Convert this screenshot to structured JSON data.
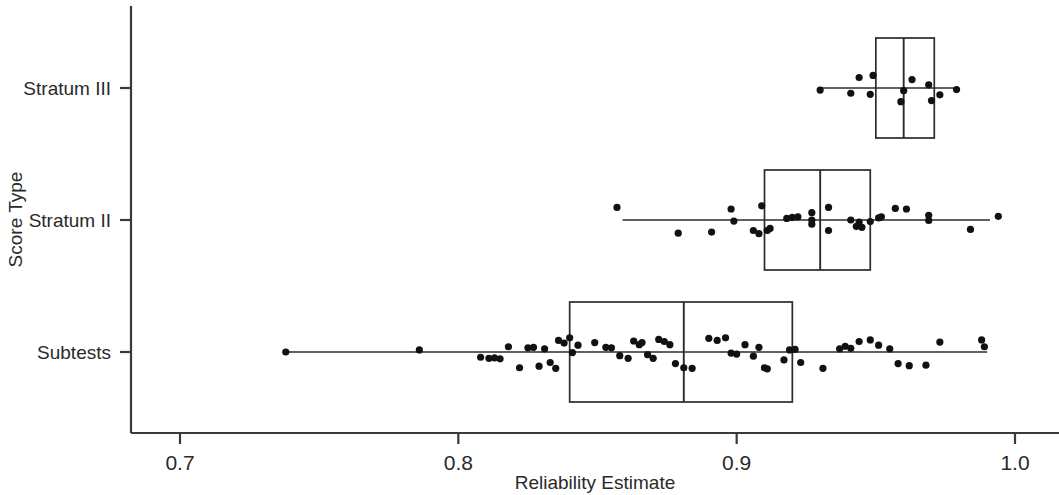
{
  "chart_data": {
    "type": "box",
    "title": "",
    "xlabel": "Reliability Estimate",
    "ylabel": "Score Type",
    "orientation": "horizontal",
    "grid": false,
    "legend": null,
    "xlim": [
      0.665,
      1.02
    ],
    "xticks": [
      0.7,
      0.8,
      0.9,
      1.0
    ],
    "xticklabels": [
      "0.7",
      "0.8",
      "0.9",
      "1.0"
    ],
    "categories": [
      "Stratum III",
      "Stratum II",
      "Subtests"
    ],
    "series": [
      {
        "name": "Stratum III",
        "q1": 0.95,
        "median": 0.96,
        "q3": 0.971,
        "whisker_low": 0.93,
        "whisker_high": 0.979,
        "points": [
          {
            "x": 0.93,
            "jitter": 0.04
          },
          {
            "x": 0.944,
            "jitter": -0.2
          },
          {
            "x": 0.949,
            "jitter": -0.24
          },
          {
            "x": 0.941,
            "jitter": 0.1
          },
          {
            "x": 0.948,
            "jitter": 0.12
          },
          {
            "x": 0.96,
            "jitter": 0.05
          },
          {
            "x": 0.963,
            "jitter": -0.16
          },
          {
            "x": 0.959,
            "jitter": 0.26
          },
          {
            "x": 0.969,
            "jitter": -0.06
          },
          {
            "x": 0.97,
            "jitter": 0.24
          },
          {
            "x": 0.973,
            "jitter": 0.13
          },
          {
            "x": 0.979,
            "jitter": 0.03
          }
        ]
      },
      {
        "name": "Stratum II",
        "q1": 0.91,
        "median": 0.93,
        "q3": 0.948,
        "whisker_low": 0.859,
        "whisker_high": 0.991,
        "points": [
          {
            "x": 0.857,
            "jitter": -0.24
          },
          {
            "x": 0.898,
            "jitter": -0.21
          },
          {
            "x": 0.909,
            "jitter": -0.27
          },
          {
            "x": 0.899,
            "jitter": 0.02
          },
          {
            "x": 0.879,
            "jitter": 0.25
          },
          {
            "x": 0.891,
            "jitter": 0.23
          },
          {
            "x": 0.906,
            "jitter": 0.2
          },
          {
            "x": 0.912,
            "jitter": 0.16
          },
          {
            "x": 0.918,
            "jitter": -0.03
          },
          {
            "x": 0.92,
            "jitter": -0.05
          },
          {
            "x": 0.922,
            "jitter": -0.06
          },
          {
            "x": 0.927,
            "jitter": -0.14
          },
          {
            "x": 0.927,
            "jitter": 0.0
          },
          {
            "x": 0.927,
            "jitter": 0.08
          },
          {
            "x": 0.933,
            "jitter": -0.24
          },
          {
            "x": 0.933,
            "jitter": 0.2
          },
          {
            "x": 0.911,
            "jitter": 0.2
          },
          {
            "x": 0.908,
            "jitter": 0.26
          },
          {
            "x": 0.941,
            "jitter": 0.0
          },
          {
            "x": 0.944,
            "jitter": 0.04
          },
          {
            "x": 0.943,
            "jitter": 0.12
          },
          {
            "x": 0.945,
            "jitter": 0.14
          },
          {
            "x": 0.948,
            "jitter": 0.03
          },
          {
            "x": 0.951,
            "jitter": -0.04
          },
          {
            "x": 0.952,
            "jitter": -0.06
          },
          {
            "x": 0.957,
            "jitter": -0.22
          },
          {
            "x": 0.961,
            "jitter": -0.21
          },
          {
            "x": 0.969,
            "jitter": -0.09
          },
          {
            "x": 0.969,
            "jitter": 0.01
          },
          {
            "x": 0.984,
            "jitter": 0.18
          },
          {
            "x": 0.994,
            "jitter": -0.07
          }
        ]
      },
      {
        "name": "Subtests",
        "q1": 0.84,
        "median": 0.881,
        "q3": 0.92,
        "whisker_low": 0.738,
        "whisker_high": 0.99,
        "points": [
          {
            "x": 0.738,
            "jitter": 0.0
          },
          {
            "x": 0.786,
            "jitter": -0.04
          },
          {
            "x": 0.808,
            "jitter": 0.1
          },
          {
            "x": 0.811,
            "jitter": 0.12
          },
          {
            "x": 0.813,
            "jitter": 0.11
          },
          {
            "x": 0.815,
            "jitter": 0.13
          },
          {
            "x": 0.818,
            "jitter": -0.1
          },
          {
            "x": 0.822,
            "jitter": 0.3
          },
          {
            "x": 0.825,
            "jitter": -0.08
          },
          {
            "x": 0.827,
            "jitter": -0.09
          },
          {
            "x": 0.829,
            "jitter": 0.27
          },
          {
            "x": 0.831,
            "jitter": -0.06
          },
          {
            "x": 0.833,
            "jitter": 0.2
          },
          {
            "x": 0.836,
            "jitter": -0.22
          },
          {
            "x": 0.838,
            "jitter": -0.17
          },
          {
            "x": 0.835,
            "jitter": 0.31
          },
          {
            "x": 0.84,
            "jitter": -0.27
          },
          {
            "x": 0.841,
            "jitter": 0.01
          },
          {
            "x": 0.843,
            "jitter": -0.13
          },
          {
            "x": 0.849,
            "jitter": -0.18
          },
          {
            "x": 0.853,
            "jitter": -0.09
          },
          {
            "x": 0.855,
            "jitter": -0.08
          },
          {
            "x": 0.858,
            "jitter": 0.07
          },
          {
            "x": 0.861,
            "jitter": 0.12
          },
          {
            "x": 0.863,
            "jitter": -0.21
          },
          {
            "x": 0.865,
            "jitter": -0.14
          },
          {
            "x": 0.866,
            "jitter": -0.18
          },
          {
            "x": 0.868,
            "jitter": 0.05
          },
          {
            "x": 0.87,
            "jitter": 0.12
          },
          {
            "x": 0.872,
            "jitter": -0.24
          },
          {
            "x": 0.874,
            "jitter": -0.2
          },
          {
            "x": 0.876,
            "jitter": -0.14
          },
          {
            "x": 0.878,
            "jitter": 0.22
          },
          {
            "x": 0.881,
            "jitter": 0.3
          },
          {
            "x": 0.884,
            "jitter": 0.31
          },
          {
            "x": 0.89,
            "jitter": -0.26
          },
          {
            "x": 0.893,
            "jitter": -0.22
          },
          {
            "x": 0.896,
            "jitter": -0.27
          },
          {
            "x": 0.898,
            "jitter": 0.02
          },
          {
            "x": 0.9,
            "jitter": 0.04
          },
          {
            "x": 0.903,
            "jitter": -0.14
          },
          {
            "x": 0.906,
            "jitter": 0.08
          },
          {
            "x": 0.908,
            "jitter": -0.09
          },
          {
            "x": 0.91,
            "jitter": 0.3
          },
          {
            "x": 0.911,
            "jitter": 0.32
          },
          {
            "x": 0.917,
            "jitter": 0.15
          },
          {
            "x": 0.919,
            "jitter": -0.04
          },
          {
            "x": 0.921,
            "jitter": -0.05
          },
          {
            "x": 0.923,
            "jitter": 0.2
          },
          {
            "x": 0.931,
            "jitter": 0.31
          },
          {
            "x": 0.937,
            "jitter": -0.06
          },
          {
            "x": 0.939,
            "jitter": -0.11
          },
          {
            "x": 0.941,
            "jitter": -0.07
          },
          {
            "x": 0.944,
            "jitter": -0.2
          },
          {
            "x": 0.948,
            "jitter": -0.23
          },
          {
            "x": 0.951,
            "jitter": -0.13
          },
          {
            "x": 0.955,
            "jitter": -0.06
          },
          {
            "x": 0.958,
            "jitter": 0.22
          },
          {
            "x": 0.962,
            "jitter": 0.26
          },
          {
            "x": 0.968,
            "jitter": 0.25
          },
          {
            "x": 0.973,
            "jitter": -0.19
          },
          {
            "x": 0.988,
            "jitter": -0.23
          },
          {
            "x": 0.989,
            "jitter": -0.1
          }
        ]
      }
    ]
  },
  "axes": {
    "x_title": "Reliability Estimate",
    "y_title": "Score Type",
    "x_tick_labels": [
      "0.7",
      "0.8",
      "0.9",
      "1.0"
    ],
    "y_tick_labels": [
      "Stratum III",
      "Stratum II",
      "Subtests"
    ]
  },
  "colors": {
    "ink": "#111111",
    "axis": "#3a3a3a",
    "background": "#ffffff"
  }
}
